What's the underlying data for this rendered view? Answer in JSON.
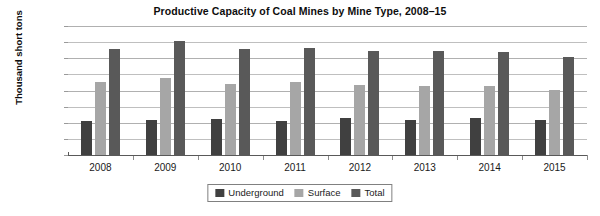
{
  "chart_data": {
    "type": "bar",
    "title": "Productive Capacity of Coal Mines by Mine Type, 2008–15",
    "xlabel": "",
    "ylabel": "Thousand short tons",
    "categories": [
      "2008",
      "2009",
      "2010",
      "2011",
      "2012",
      "2013",
      "2014",
      "2015"
    ],
    "series": [
      {
        "name": "Underground",
        "color": "#404040",
        "values": [
          420000,
          430000,
          450000,
          420000,
          460000,
          430000,
          460000,
          430000
        ]
      },
      {
        "name": "Surface",
        "color": "#a6a6a6",
        "values": [
          910000,
          960000,
          880000,
          900000,
          870000,
          860000,
          850000,
          810000
        ]
      },
      {
        "name": "Total",
        "color": "#595959",
        "values": [
          1310000,
          1420000,
          1310000,
          1330000,
          1290000,
          1290000,
          1280000,
          1210000
        ]
      }
    ],
    "ylim": [
      0,
      1600000
    ],
    "y_major_ticks": [
      "0",
      "400,000",
      "800,000",
      "1,200,000",
      "1,600,000"
    ],
    "y_major_values": [
      0,
      400000,
      800000,
      1200000,
      1600000
    ],
    "y_minor_values": [
      200000,
      600000,
      1000000,
      1400000
    ],
    "grid": true,
    "legend_position": "bottom",
    "legend": [
      "Underground",
      "Surface",
      "Total"
    ]
  }
}
